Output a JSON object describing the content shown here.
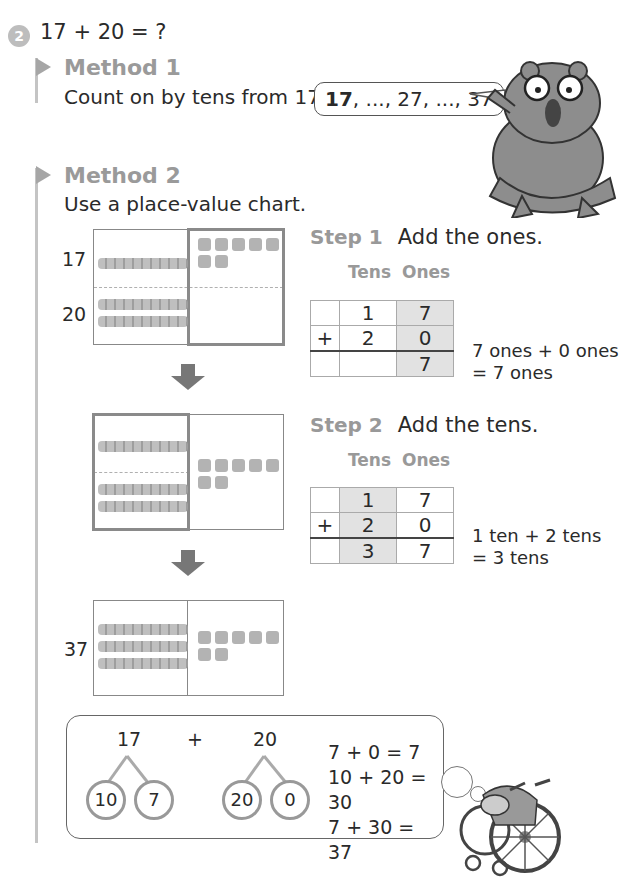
{
  "question": {
    "number": "2",
    "text": "17 + 20 = ?"
  },
  "method1": {
    "title": "Method 1",
    "instruction": "Count on by tens from 17.",
    "speech_bubble": {
      "bold_start": "17",
      "rest": ", ..., 27, ..., 37"
    },
    "character": "bear-with-glasses-illustration"
  },
  "method2": {
    "title": "Method 2",
    "instruction": "Use a place-value chart.",
    "chart1": {
      "labels": [
        "17",
        "20"
      ],
      "row1": {
        "tens_rods": 1,
        "ones_cubes": 7
      },
      "row2": {
        "tens_rods": 2,
        "ones_cubes": 0
      },
      "highlight": "ones"
    },
    "chart2": {
      "highlight": "tens",
      "tens_rods": 3,
      "ones_cubes": 7
    },
    "chart3": {
      "label": "37",
      "tens_rods": 3,
      "ones_cubes": 7
    },
    "step1": {
      "label": "Step 1",
      "text": "Add the ones.",
      "col_tens": "Tens",
      "col_ones": "Ones",
      "rows": [
        {
          "sign": "",
          "tens": "1",
          "ones": "7"
        },
        {
          "sign": "+",
          "tens": "2",
          "ones": "0"
        },
        {
          "sign": "",
          "tens": "",
          "ones": "7"
        }
      ],
      "explanation_line1": "7 ones + 0 ones",
      "explanation_line2": "= 7 ones"
    },
    "step2": {
      "label": "Step 2",
      "text": "Add the tens.",
      "col_tens": "Tens",
      "col_ones": "Ones",
      "rows": [
        {
          "sign": "",
          "tens": "1",
          "ones": "7"
        },
        {
          "sign": "+",
          "tens": "2",
          "ones": "0"
        },
        {
          "sign": "",
          "tens": "3",
          "ones": "7"
        }
      ],
      "explanation_line1": "1 ten + 2 tens",
      "explanation_line2": "= 3 tens"
    }
  },
  "number_bond": {
    "left_whole": "17",
    "left_parts": [
      "10",
      "7"
    ],
    "plus": "+",
    "right_whole": "20",
    "right_parts": [
      "20",
      "0"
    ],
    "equations": [
      "7 + 0 = 7",
      "10 + 20 = 30",
      "7 + 30 = 37"
    ],
    "character": "hedgehog-in-wheelchair-illustration"
  }
}
